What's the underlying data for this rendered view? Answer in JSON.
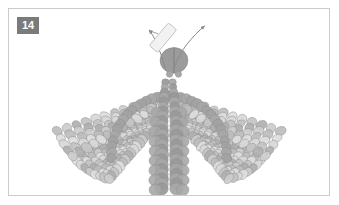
{
  "panel": {
    "badge_label": "14",
    "badge_bg": "#7b7b7b",
    "badge_text_color": "#ffffff"
  },
  "frame": {
    "border_color": "#c9cbcd",
    "background": "#ffffff",
    "x": 8,
    "y": 8,
    "width": 322,
    "height": 188
  },
  "figure": {
    "title": "",
    "caption": "",
    "type": "scientific-illustration",
    "palette": {
      "core_dark": "#9a9a9a",
      "core_mid": "#a8a8a8",
      "arch": "#a3a3a3",
      "scale_light": "#d8d8d8",
      "scale_mid": "#c4c4c4",
      "scale_dark": "#b0b0b0",
      "outline": "#8e8e8e",
      "head": "#9b9b9b",
      "head_outline": "#7e7e7e",
      "antenna": "#8a8a8a",
      "tag_fill": "#f2f2f2",
      "tag_outline": "#b9b9b9",
      "ground_line": "#d0d0d0"
    },
    "head": {
      "label": "head",
      "cx": 174,
      "cy": 60,
      "rx": 14,
      "ry": 13,
      "split": true
    },
    "antennae": [
      {
        "label": "left-antenna",
        "tip_x": 148,
        "tip_y": 27,
        "arrow": true
      },
      {
        "label": "right-antenna",
        "tip_x": 205,
        "tip_y": 23,
        "arrow": true
      }
    ],
    "tag": {
      "label": "specimen-tag",
      "cx": 163,
      "cy": 37,
      "w": 11,
      "h": 30,
      "rotation_deg": 40
    },
    "ground_line": {
      "y": 190,
      "x1": 30,
      "x2": 300
    }
  },
  "chart_data": {
    "type": "scatter",
    "title": "",
    "xlabel": "",
    "ylabel": "",
    "legend": []
  }
}
